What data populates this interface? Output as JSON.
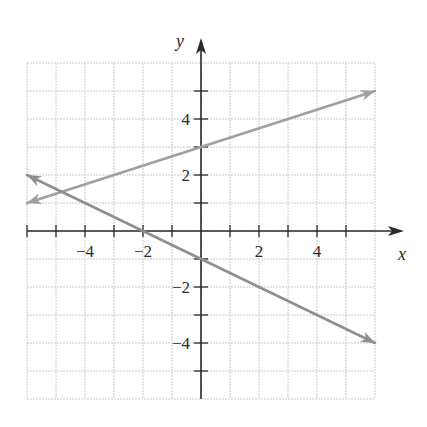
{
  "chart_data": {
    "type": "line",
    "title": "",
    "xlabel": "x",
    "ylabel": "y",
    "xlim": [
      -6,
      6
    ],
    "ylim": [
      -6,
      6
    ],
    "grid": true,
    "x_ticks": [
      -6,
      -5,
      -4,
      -3,
      -2,
      -1,
      1,
      2,
      3,
      4,
      5
    ],
    "y_ticks": [
      -5,
      -4,
      -3,
      -2,
      -1,
      1,
      2,
      3,
      4,
      5
    ],
    "x_tick_labels": [
      {
        "value": -4,
        "label": "−4"
      },
      {
        "value": -2,
        "label": "−2"
      },
      {
        "value": 2,
        "label": "2"
      },
      {
        "value": 4,
        "label": "4"
      }
    ],
    "y_tick_labels": [
      {
        "value": 4,
        "label": "4"
      },
      {
        "value": 2,
        "label": "2"
      },
      {
        "value": -2,
        "label": "−2"
      },
      {
        "value": -4,
        "label": "−4"
      }
    ],
    "legend": null,
    "series": [
      {
        "name": "line-1",
        "equation": "y = x/3 + 3",
        "points": [
          [
            -6,
            1
          ],
          [
            0,
            3
          ],
          [
            6,
            5
          ]
        ],
        "arrows": "both",
        "color": "#a0a0a0"
      },
      {
        "name": "line-2",
        "equation": "y = -x/2 - 1",
        "points": [
          [
            -6,
            2
          ],
          [
            -2,
            0
          ],
          [
            0,
            -1
          ],
          [
            2,
            -2
          ],
          [
            4,
            -3
          ],
          [
            6,
            -4
          ]
        ],
        "arrows": "both",
        "color": "#8f8f8f"
      }
    ]
  },
  "style": {
    "axis_color": "#2a2a2a",
    "grid_color": "#c8c8c8",
    "background": "#ffffff"
  }
}
